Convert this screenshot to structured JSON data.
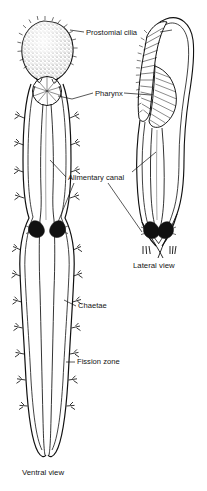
{
  "figure": {
    "background_color": "#ffffff",
    "ink_color": "#000000",
    "labels": [
      {
        "id": "prostomial-cilia",
        "text": "Prostomial cilia",
        "x": 86,
        "y": 29
      },
      {
        "id": "pharynx",
        "text": "Pharynx",
        "x": 95,
        "y": 90
      },
      {
        "id": "alimentary-canal",
        "text": "Alimentary canal",
        "x": 68,
        "y": 174
      },
      {
        "id": "chaetae",
        "text": "Chaetae",
        "x": 78,
        "y": 304
      },
      {
        "id": "fission-zone",
        "text": "Fission zone",
        "x": 77,
        "y": 360
      }
    ],
    "captions": [
      {
        "id": "lateral-view",
        "text": "Lateral view",
        "x": 133,
        "y": 262
      },
      {
        "id": "ventral-view",
        "text": "Ventral view",
        "x": 22,
        "y": 469
      }
    ],
    "views": [
      {
        "id": "ventral",
        "caption": "Ventral view"
      },
      {
        "id": "lateral",
        "caption": "Lateral view"
      }
    ]
  }
}
